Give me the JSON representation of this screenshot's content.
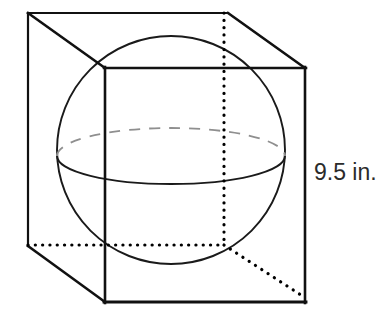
{
  "figure": {
    "labels": {
      "side_length": "9.5 in."
    },
    "colors": {
      "stroke_solid": "#111111",
      "stroke_sphere": "#1a1a1a",
      "stroke_hidden_dashed": "#8c8c8c",
      "stroke_dotted": "#000000",
      "background": "#ffffff",
      "text": "#2b2b2b"
    },
    "geometry": {
      "cube": {
        "front_face": {
          "top_left": [
            105,
            68
          ],
          "top_right": [
            305,
            68
          ],
          "bottom_right": [
            305,
            302
          ],
          "bottom_left": [
            105,
            302
          ]
        },
        "back_face": {
          "top_left": [
            28,
            13
          ],
          "top_right": [
            228,
            13
          ],
          "bottom_right": [
            228,
            247
          ],
          "bottom_left": [
            28,
            247
          ]
        },
        "edge_label_side": "9.5 in."
      },
      "sphere": {
        "center": [
          171,
          150
        ],
        "radius": 114,
        "equator": {
          "center": [
            171,
            156
          ],
          "rx": 114,
          "ry": 28,
          "back_arc_style": "dashed",
          "front_arc_style": "solid"
        }
      },
      "dotted_guides": [
        {
          "name": "vertical-axis",
          "from": [
            224,
            13
          ],
          "to": [
            224,
            245
          ]
        },
        {
          "name": "horizontal-depth",
          "from": [
            28,
            245
          ],
          "to": [
            224,
            245
          ]
        },
        {
          "name": "diagonal-depth",
          "from": [
            224,
            245
          ],
          "to": [
            304,
            297
          ]
        }
      ]
    }
  }
}
